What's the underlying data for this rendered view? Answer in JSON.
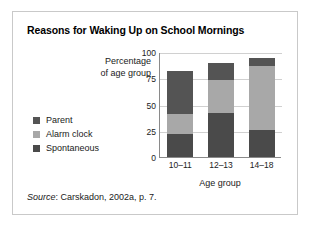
{
  "figure": {
    "title": "Reasons for Waking Up on School Mornings",
    "source_word": "Source",
    "source_rest": ": Carskadon, 2002a, p. 7."
  },
  "chart_data": {
    "type": "bar",
    "subtype": "stacked-bar",
    "title": "Reasons for Waking Up on School Mornings",
    "xlabel": "Age group",
    "ylabel": "Percentage of age group",
    "categories": [
      "10–11",
      "12–13",
      "14–18"
    ],
    "series": [
      {
        "name": "Spontaneous",
        "values": [
          22,
          42,
          26
        ],
        "color": "#4a4a4a"
      },
      {
        "name": "Alarm clock",
        "values": [
          19,
          31,
          61
        ],
        "color": "#a8a8a8"
      },
      {
        "name": "Parent",
        "values": [
          41,
          17,
          7
        ],
        "color": "#545454"
      }
    ],
    "stack_tops": [
      82,
      90,
      94
    ],
    "ylim": [
      0,
      100
    ],
    "yticks": [
      0,
      25,
      50,
      75,
      100
    ],
    "ytick_labels": [
      "0",
      "25",
      "50",
      "75",
      "100"
    ],
    "grid": true,
    "legend_position": "left",
    "legend_order": [
      "Parent",
      "Alarm clock",
      "Spontaneous"
    ]
  },
  "legend": {
    "items": [
      {
        "label": "Parent",
        "color": "#545454"
      },
      {
        "label": "Alarm clock",
        "color": "#a8a8a8"
      },
      {
        "label": "Spontaneous",
        "color": "#4a4a4a"
      }
    ]
  },
  "colors": {
    "card_border": "#c9c9c9",
    "axis": "#8a8a8a",
    "gridline": "#d0d0d0",
    "background": "#ffffff"
  }
}
